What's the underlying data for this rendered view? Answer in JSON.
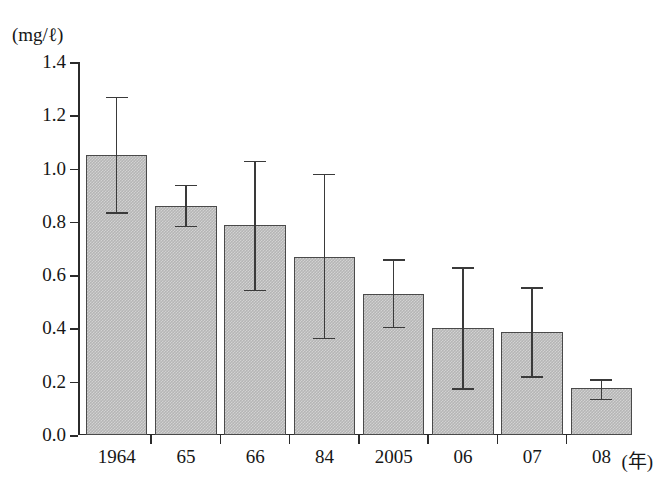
{
  "chart_data": {
    "type": "bar",
    "title": "",
    "subtitle": "",
    "xlabel": "年",
    "ylabel": "(mg/ℓ)",
    "unit_label": "(mg/ℓ)",
    "categories": [
      "1964",
      "65",
      "66",
      "84",
      "2005",
      "06",
      "07",
      "08"
    ],
    "x_axis_suffix": "(年)",
    "values": [
      1.05,
      0.86,
      0.79,
      0.67,
      0.53,
      0.4,
      0.385,
      0.175
    ],
    "error_low": [
      0.83,
      0.78,
      0.54,
      0.36,
      0.4,
      0.17,
      0.215,
      0.13
    ],
    "error_high": [
      1.27,
      0.94,
      1.03,
      0.98,
      0.66,
      0.63,
      0.555,
      0.21
    ],
    "ylim": [
      0.0,
      1.4
    ],
    "yticks": [
      0.0,
      0.2,
      0.4,
      0.6,
      0.8,
      1.0,
      1.2,
      1.4
    ],
    "ytick_labels": [
      "0.0",
      "0.2",
      "0.4",
      "0.6",
      "0.8",
      "1.0",
      "1.2",
      "1.4"
    ],
    "grid": false,
    "legend": "none",
    "error_bar_style": "capped-whisker",
    "bar_fill_color": "#b5b5b5",
    "bar_edge_color": "#4a4a4a",
    "axis_color": "#2b2b2b",
    "background_color": "#ffffff"
  },
  "axis": {
    "unit_caption": "(mg/ℓ)",
    "year_suffix": "(年)"
  }
}
